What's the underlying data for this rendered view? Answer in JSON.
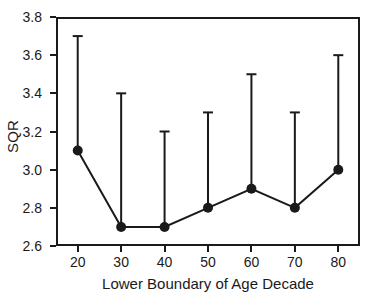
{
  "chart_data": {
    "type": "line",
    "title": "",
    "subtitle": "",
    "xlabel": "Lower Boundary of Age Decade",
    "ylabel": "SQR",
    "x": [
      20,
      30,
      40,
      50,
      60,
      70,
      80
    ],
    "xticklabels": [
      "20",
      "30",
      "40",
      "50",
      "60",
      "70",
      "80"
    ],
    "yticklabels": [
      "2.6",
      "2.8",
      "3.0",
      "3.2",
      "3.4",
      "3.6",
      "3.8"
    ],
    "yticks": [
      2.6,
      2.8,
      3.0,
      3.2,
      3.4,
      3.6,
      3.8
    ],
    "xlim": [
      15,
      85
    ],
    "ylim": [
      2.6,
      3.8
    ],
    "grid": false,
    "legend": null,
    "errorbar_style": "upper-only",
    "marker": "filled-circle",
    "color": "#1a1a1a",
    "series": [
      {
        "name": "SQR",
        "values": [
          3.1,
          2.7,
          2.7,
          2.8,
          2.9,
          2.8,
          3.0
        ],
        "error_upper": [
          3.7,
          3.4,
          3.2,
          3.3,
          3.5,
          3.3,
          3.6
        ]
      }
    ]
  }
}
